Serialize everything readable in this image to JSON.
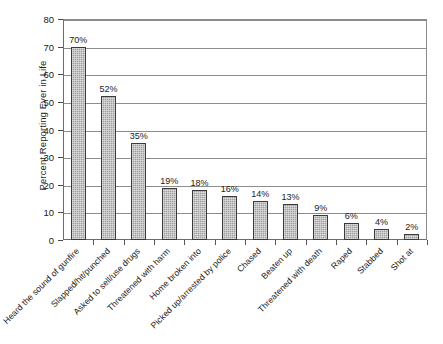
{
  "chart_data": {
    "type": "bar",
    "title": "",
    "subtitle": "",
    "xlabel": "",
    "ylabel": "Percent Reporting Ever in Life",
    "ylim": [
      0,
      80
    ],
    "ytick_values": [
      0,
      10,
      20,
      30,
      40,
      50,
      60,
      70,
      80
    ],
    "ytick_labels": [
      "0",
      "10",
      "20",
      "30",
      "40",
      "50",
      "60",
      "70",
      "80"
    ],
    "grid": "horizontal",
    "legend": "none",
    "bar_color": "#9e9e9e",
    "bar_border_color": "#3a3a3a",
    "categories": [
      "Heard the sound of gunfire",
      "Slapped/hit/punched",
      "Asked to sell/use drugs",
      "Threatened with harm",
      "Home broken into",
      "Picked up/arrested by police",
      "Chased",
      "Beaten up",
      "Threatened with death",
      "Raped",
      "Stabbed",
      "Shot at"
    ],
    "values": [
      70,
      52,
      35,
      19,
      18,
      16,
      14,
      13,
      9,
      6,
      4,
      2
    ],
    "data_labels": [
      "70%",
      "52%",
      "35%",
      "19%",
      "18%",
      "16%",
      "14%",
      "13%",
      "9%",
      "6%",
      "4%",
      "2%"
    ]
  }
}
